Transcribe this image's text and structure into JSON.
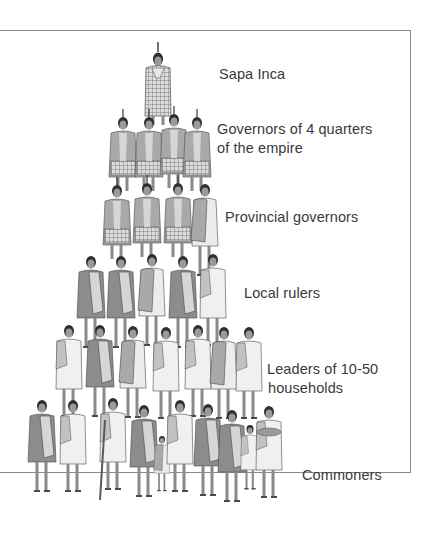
{
  "colors": {
    "border": "#8a8a8a",
    "text": "#3a3a3a",
    "cloak_dark": "#8c8c8c",
    "cloak_mid": "#a9a9a9",
    "cloak_light": "#d6d6d6",
    "tunic_white": "#ececec",
    "hair": "#2e2e2e",
    "skin": "#9a9a9a",
    "outline": "#4a4a4a"
  },
  "tiers": [
    {
      "label": "Sapa Inca",
      "figure_count": 1
    },
    {
      "label_line1": "Governors of 4 quarters",
      "label_line2": "of the empire",
      "figure_count": 4
    },
    {
      "label": "Provincial governors",
      "figure_count": 4
    },
    {
      "label": "Local rulers",
      "figure_count": 5
    },
    {
      "label_line1": "Leaders of 10-50",
      "label_line2": "households",
      "figure_count": 7
    },
    {
      "label": "Commoners",
      "figure_count": 11
    }
  ]
}
